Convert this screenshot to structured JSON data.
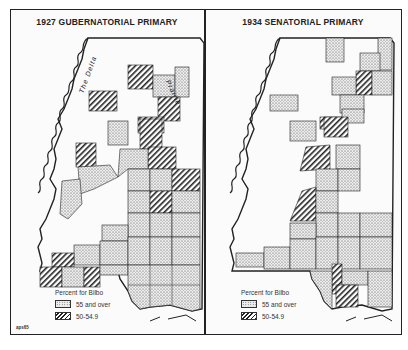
{
  "figure": {
    "code": "aps65"
  },
  "maps": [
    {
      "title": "1927 GUBERNATORIAL PRIMARY",
      "labels": [
        "The Delta",
        "Prairie"
      ],
      "legend": {
        "title": "Percent for Bilbo",
        "items": [
          {
            "pattern": "dots",
            "label": "55 and over"
          },
          {
            "pattern": "hatch",
            "label": "50-54.9"
          }
        ]
      }
    },
    {
      "title": "1934 SENATORIAL PRIMARY",
      "legend": {
        "title": "Percent for Bilbo",
        "items": [
          {
            "pattern": "dots",
            "label": "55 and over"
          },
          {
            "pattern": "hatch",
            "label": "50-54.9"
          }
        ]
      }
    }
  ],
  "colors": {
    "ink": "#222222",
    "paper": "#fbfbfb",
    "dots_fill": "#e6e6e6"
  }
}
